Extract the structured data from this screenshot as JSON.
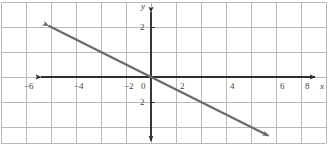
{
  "figure": {
    "type": "coordinate-plane",
    "width": 332,
    "height": 149,
    "background_color": "#ffffff",
    "grid_color": "#b8b8c0",
    "axis_color": "#2e2e33",
    "line_color": "#6a6a6a",
    "label_color": "#444448"
  },
  "axes": {
    "x_axis_name": "x",
    "y_axis_name": "y",
    "origin_label": "0",
    "x_ticks": [
      {
        "label": "−6",
        "value": -6
      },
      {
        "label": "−4",
        "value": -4
      },
      {
        "label": "−2",
        "value": -2
      },
      {
        "label": "2",
        "value": 2
      },
      {
        "label": "4",
        "value": 4
      },
      {
        "label": "6",
        "value": 6
      },
      {
        "label": "8",
        "value": 8
      }
    ],
    "y_ticks": [
      {
        "label": "2",
        "value": 2
      },
      {
        "label": "2",
        "value": -2
      }
    ],
    "x_range": [
      -7.0,
      9.0
    ],
    "y_range": [
      -3.2,
      3.0
    ],
    "arrowheads": [
      "left",
      "right",
      "up",
      "down"
    ]
  },
  "chart_data": {
    "type": "line",
    "title": "",
    "xlabel": "x",
    "ylabel": "y",
    "grid": true,
    "legend": "none",
    "xlim": [
      -7.0,
      9.0
    ],
    "ylim": [
      -3.2,
      3.0
    ],
    "xticks": [
      -6,
      -4,
      -2,
      0,
      2,
      4,
      6,
      8
    ],
    "yticks": [
      2,
      -2
    ],
    "series": [
      {
        "name": "line",
        "equation": "y = -x/2",
        "slope": -0.5,
        "y_intercept": 0,
        "x_intercept": 0,
        "arrow_both_ends": true,
        "x": [
          -4.1,
          0,
          4.7
        ],
        "values": [
          2.05,
          0,
          -2.35
        ],
        "points": [
          {
            "x": -4.1,
            "y": 2.05
          },
          {
            "x": -2,
            "y": 1
          },
          {
            "x": 0,
            "y": 0
          },
          {
            "x": 2,
            "y": -1
          },
          {
            "x": 4.7,
            "y": -2.35
          }
        ]
      }
    ]
  }
}
